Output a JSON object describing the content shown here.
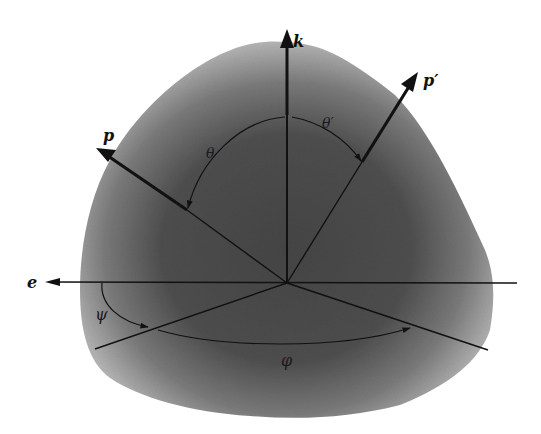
{
  "diagram": {
    "colors": {
      "background": "#ffffff",
      "surface_edge": "#b8b8b8",
      "surface_core": "#4a4a4a",
      "ink": "#111111"
    },
    "vectors": [
      {
        "id": "k",
        "label": "k",
        "from": [
          287,
          283
        ],
        "to": [
          287,
          29
        ]
      },
      {
        "id": "p_prime",
        "label": "p′",
        "from": [
          287,
          283
        ],
        "to": [
          418,
          72
        ]
      },
      {
        "id": "p",
        "label": "p",
        "from": [
          187,
          210
        ],
        "to": [
          96,
          148
        ]
      },
      {
        "id": "e",
        "label": "e",
        "from": [
          517,
          283
        ],
        "to": [
          45,
          282
        ]
      }
    ],
    "angles": [
      {
        "id": "theta",
        "label": "θ"
      },
      {
        "id": "theta_prime",
        "label": "θ′"
      },
      {
        "id": "psi",
        "label": "ψ"
      },
      {
        "id": "phi",
        "label": "φ"
      }
    ],
    "labels": {
      "k": "k",
      "p_prime": "p′",
      "p": "p",
      "e": "e",
      "theta": "θ",
      "theta_prime": "θ′",
      "psi": "ψ",
      "phi": "φ"
    }
  }
}
